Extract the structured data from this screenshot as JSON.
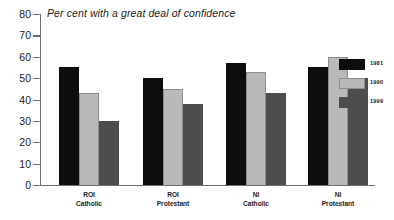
{
  "chart_data": {
    "type": "bar",
    "title": "Per cent with a great deal of confidence",
    "xlabel": "",
    "ylabel": "",
    "ylim": [
      0,
      80
    ],
    "ytick_step": 10,
    "yticks": [
      80,
      70,
      60,
      50,
      40,
      30,
      20,
      10,
      0
    ],
    "grid": false,
    "legend_position": "right",
    "categories": [
      "ROI\nCatholic",
      "ROI\nProtestant",
      "NI\nCatholic",
      "NI\nProtestant"
    ],
    "category_lines": [
      [
        "ROI",
        "Catholic"
      ],
      [
        "ROI",
        "Protestant"
      ],
      [
        "NI",
        "Catholic"
      ],
      [
        "NI",
        "Protestant"
      ]
    ],
    "series": [
      {
        "name": "1981",
        "color": "#0d0d0d",
        "values": [
          55,
          50,
          57,
          55
        ]
      },
      {
        "name": "1990",
        "color": "#b9b9b9",
        "values": [
          43,
          45,
          53,
          60
        ]
      },
      {
        "name": "1999",
        "color": "#4d4d4d",
        "values": [
          30,
          38,
          43,
          50
        ]
      }
    ]
  },
  "colors": {
    "axis": "#6e6e6e",
    "text": "#1b1b1b",
    "background": "#ffffff",
    "series_1981": "#0d0d0d",
    "series_1990": "#b9b9b9",
    "series_1999": "#4d4d4d"
  }
}
